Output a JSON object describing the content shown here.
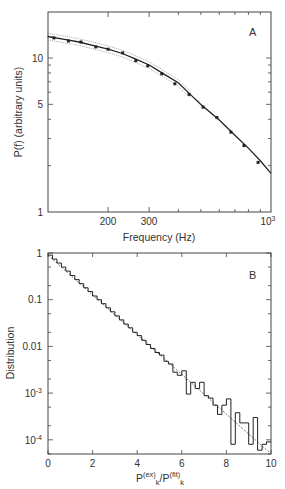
{
  "chart_data": [
    {
      "type": "scatter",
      "panel_label": "A",
      "title": "",
      "xlabel": "Frequency (Hz)",
      "ylabel": "P(f) (arbitrary units)",
      "xscale": "log",
      "yscale": "log",
      "xlim": [
        110,
        1000
      ],
      "ylim": [
        1,
        20
      ],
      "xtick_labels": [
        "200",
        "300",
        "10^3"
      ],
      "xtick_values": [
        200,
        300,
        1000
      ],
      "ytick_labels": [
        "1",
        "5",
        "10"
      ],
      "ytick_values": [
        1,
        5,
        10
      ],
      "grid": false,
      "series": [
        {
          "name": "data points",
          "style": "markers",
          "x": [
            117,
            135,
            153,
            177,
            200,
            231,
            263,
            296,
            340,
            387,
            445,
            511,
            586,
            673,
            766,
            880
          ],
          "y": [
            13.5,
            12.9,
            12.7,
            11.8,
            11.4,
            10.8,
            9.6,
            8.9,
            7.9,
            6.8,
            5.8,
            4.8,
            4.1,
            3.3,
            2.7,
            2.1
          ]
        },
        {
          "name": "fit",
          "style": "solid line",
          "x": [
            110,
            130,
            150,
            175,
            200,
            230,
            260,
            300,
            350,
            400,
            450,
            500,
            600,
            700,
            800,
            900,
            1000
          ],
          "y": [
            13.8,
            13.2,
            12.7,
            12.0,
            11.4,
            10.7,
            9.9,
            9.0,
            7.8,
            6.9,
            5.8,
            5.0,
            3.95,
            3.15,
            2.6,
            2.15,
            1.78
          ]
        },
        {
          "name": "confidence band",
          "style": "dotted lines",
          "note": "thin dotted envelope around fit, visible at low frequencies"
        }
      ]
    },
    {
      "type": "histogram",
      "panel_label": "B",
      "title": "",
      "xlabel": "P(ex)k / P(fit)k",
      "ylabel": "Distribution",
      "xscale": "linear",
      "yscale": "log",
      "xlim": [
        0,
        10
      ],
      "ylim": [
        5e-05,
        1
      ],
      "xtick_labels": [
        "0",
        "2",
        "4",
        "6",
        "8",
        "10"
      ],
      "xtick_values": [
        0,
        2,
        4,
        6,
        8,
        10
      ],
      "ytick_labels": [
        "1",
        "0.1",
        "0.01",
        "10^-3",
        "10^-4"
      ],
      "ytick_values": [
        1,
        0.1,
        0.01,
        0.001,
        0.0001
      ],
      "grid": false,
      "series": [
        {
          "name": "histogram",
          "style": "step",
          "bin_width": 0.2,
          "bin_edges_start": 0,
          "values": [
            0.9,
            0.74,
            0.61,
            0.5,
            0.41,
            0.33,
            0.27,
            0.22,
            0.18,
            0.15,
            0.12,
            0.1,
            0.082,
            0.067,
            0.055,
            0.045,
            0.037,
            0.03,
            0.025,
            0.02,
            0.017,
            0.0135,
            0.011,
            0.009,
            0.0074,
            0.0065,
            0.0048,
            0.0042,
            0.0028,
            0.0024,
            0.003,
            0.00095,
            0.0017,
            0.00125,
            0.0017,
            0.00088,
            0.00078,
            0.00055,
            0.00035,
            0.00055,
            0.00075,
            8e-05,
            0.00038,
            0.00023,
            0.00023,
            8e-05,
            0.0003,
            6e-05,
            8e-05,
            9e-05
          ]
        },
        {
          "name": "exponential fit",
          "style": "dashed line",
          "x": [
            0,
            10
          ],
          "y": [
            0.9,
            5e-05
          ]
        }
      ]
    }
  ],
  "labels": {
    "panelA": {
      "panel": "A",
      "xlabel": "Frequency (Hz)",
      "ylabel": "P(f) (arbitrary units)",
      "yticks": [
        "10",
        "5",
        "1"
      ],
      "xticks": [
        "200",
        "300"
      ],
      "xtick_last_base": "10",
      "xtick_last_exp": "3"
    },
    "panelB": {
      "panel": "B",
      "ylabel": "Distribution",
      "xlabel_p1": "P",
      "xlabel_sup1": "(ex)",
      "xlabel_sub1": "k",
      "xlabel_slash": "/P",
      "xlabel_sup2": "(fit)",
      "xlabel_sub2": "k",
      "yticks": [
        "1",
        "0.1",
        "0.01"
      ],
      "ytick_1e3_base": "10",
      "ytick_1e3_exp": "-3",
      "ytick_1e4_base": "10",
      "ytick_1e4_exp": "-4",
      "xticks": [
        "0",
        "2",
        "4",
        "6",
        "8",
        "10"
      ]
    }
  }
}
